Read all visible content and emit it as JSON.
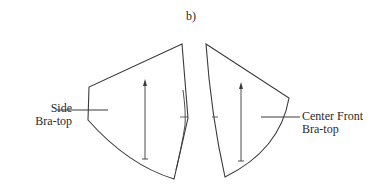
{
  "figure": {
    "label": "b)"
  },
  "pieces": [
    {
      "name": "Side Bra-top",
      "label_line1": "Side",
      "label_line2": "Bra-top"
    },
    {
      "name": "Center Front Bra-top",
      "label_line1": "Center Front",
      "label_line2": "Bra-top"
    }
  ],
  "colors": {
    "stroke": "#3a3a3a",
    "background": "#ffffff"
  }
}
